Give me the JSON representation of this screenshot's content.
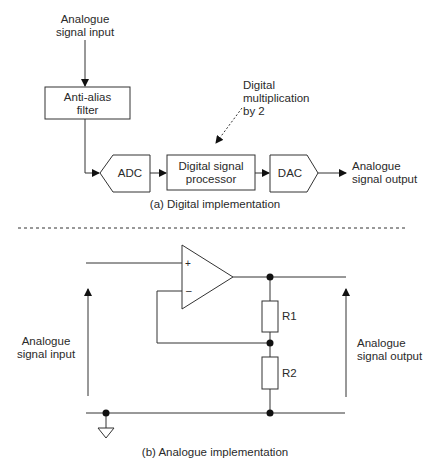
{
  "digital": {
    "input_label_1": "Analogue",
    "input_label_2": "signal input",
    "filter_1": "Anti-alias",
    "filter_2": "filter",
    "adc": "ADC",
    "dsp_1": "Digital signal",
    "dsp_2": "processor",
    "dac": "DAC",
    "output_1": "Analogue",
    "output_2": "signal output",
    "note_1": "Digital",
    "note_2": "multiplication",
    "note_3": "by 2",
    "caption": "(a) Digital implementation"
  },
  "analogue": {
    "plus": "+",
    "minus": "–",
    "r1": "R1",
    "r2": "R2",
    "input_1": "Analogue",
    "input_2": "signal input",
    "output_1": "Analogue",
    "output_2": "signal output",
    "caption": "(b) Analogue implementation"
  },
  "colors": {
    "line": "#333333",
    "text": "#2a2a2a"
  }
}
